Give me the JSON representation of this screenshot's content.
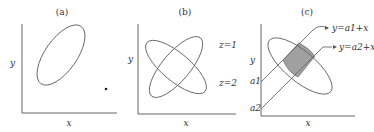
{
  "figure": {
    "panels": [
      {
        "id": "a",
        "title": "(a)",
        "xlabel": "x",
        "ylabel": "y",
        "elements": [
          "single ellipse tilted along positive diagonal",
          "isolated point (outlier) lower right"
        ]
      },
      {
        "id": "b",
        "title": "(b)",
        "xlabel": "x",
        "ylabel": "y",
        "curve_labels": [
          "z=1",
          "z=2"
        ],
        "elements": [
          "ellipse tilted negative (z=1)",
          "ellipse tilted positive (z=2)"
        ]
      },
      {
        "id": "c",
        "title": "(c)",
        "xlabel": "x",
        "ylabel": "y",
        "intercept_labels": [
          "a1",
          "a2"
        ],
        "line_labels": [
          "y=a1+x",
          "y=a2+x"
        ],
        "elements": [
          "ellipse tilted negative",
          "two parallel lines of slope 1",
          "shaded region between lines inside ellipse"
        ]
      }
    ],
    "colors": {
      "stroke": "#666666",
      "shade": "#a0a0a0",
      "text": "#333333"
    }
  }
}
